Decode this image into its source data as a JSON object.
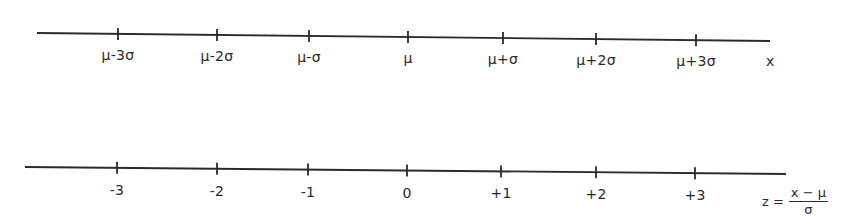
{
  "diagram": {
    "title": "",
    "line_color": "#2a2a2a",
    "top_axis": {
      "name": "x",
      "line": {
        "x1": 37,
        "y1": 33,
        "x2": 770,
        "y2": 41
      },
      "ticks": [
        {
          "x": 118,
          "label": "μ-3σ"
        },
        {
          "x": 217,
          "label": "μ-2σ"
        },
        {
          "x": 309,
          "label": "μ-σ"
        },
        {
          "x": 408,
          "label": "μ"
        },
        {
          "x": 503,
          "label": "μ+σ"
        },
        {
          "x": 596,
          "label": "μ+2σ"
        },
        {
          "x": 696,
          "label": "μ+3σ"
        }
      ]
    },
    "bottom_axis": {
      "line": {
        "x1": 25,
        "y1": 167,
        "x2": 786,
        "y2": 174
      },
      "ticks": [
        {
          "x": 117,
          "label": "-3"
        },
        {
          "x": 217,
          "label": "-2"
        },
        {
          "x": 308,
          "label": "-1"
        },
        {
          "x": 407,
          "label": "0"
        },
        {
          "x": 501,
          "label": "+1"
        },
        {
          "x": 596,
          "label": "+2"
        },
        {
          "x": 695,
          "label": "+3"
        }
      ],
      "formula": {
        "lhs": "z =",
        "numerator": "x − μ",
        "denominator": "σ"
      }
    }
  }
}
